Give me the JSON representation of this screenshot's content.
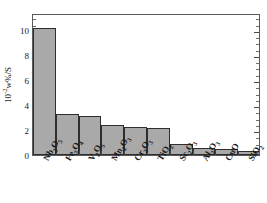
{
  "chart_data": {
    "type": "bar",
    "title": "",
    "xlabel": "",
    "ylabel": "10-2w%/S",
    "ylabel_prefix": "10",
    "ylabel_exponent": "-2",
    "ylabel_suffix": "w%/S",
    "ylim": [
      0,
      11.36
    ],
    "yticks": [
      0,
      2,
      4,
      6,
      8,
      10
    ],
    "ytick_labels": [
      "0",
      "2",
      "4",
      "6",
      "8",
      "10"
    ],
    "yminor_step": 0.5,
    "grid": false,
    "legend": null,
    "bar_fill_color": "#a9a9a9",
    "bar_edge_color": "#2e2e2e",
    "axis_color": "#5a5a5a",
    "categories": [
      "Nb2O5",
      "Fe3O4",
      "V2O5",
      "Mn2O3",
      "Cr2O3",
      "TiO2",
      "Sc2O3",
      "Al2O3",
      "CuO",
      "SiO2"
    ],
    "category_labels_html": [
      {
        "base": "Nb",
        "s1": "2",
        "mid": "O",
        "s2": "5"
      },
      {
        "base": "Fe",
        "s1": "3",
        "mid": "O",
        "s2": "4"
      },
      {
        "base": "V",
        "s1": "2",
        "mid": "O",
        "s2": "5"
      },
      {
        "base": "Mn",
        "s1": "2",
        "mid": "O",
        "s2": "3"
      },
      {
        "base": "Cr",
        "s1": "2",
        "mid": "O",
        "s2": "3"
      },
      {
        "base": "Ti",
        "s1": "",
        "mid": "O",
        "s2": "2"
      },
      {
        "base": "Sc",
        "s1": "2",
        "mid": "O",
        "s2": "3"
      },
      {
        "base": "Al",
        "s1": "2",
        "mid": "O",
        "s2": "3"
      },
      {
        "base": "Cu",
        "s1": "",
        "mid": "O",
        "s2": ""
      },
      {
        "base": "Si",
        "s1": "",
        "mid": "O",
        "s2": "2"
      }
    ],
    "values": [
      10.2,
      3.3,
      3.1,
      2.4,
      2.25,
      2.2,
      0.9,
      0.6,
      0.5,
      0.3
    ]
  }
}
